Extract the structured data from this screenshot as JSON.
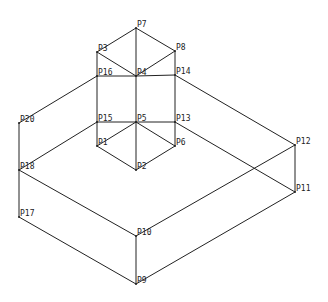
{
  "diagram": {
    "type": "isometric-wireframe",
    "vertices": [
      {
        "id": "P1",
        "label": "P1",
        "x": 97,
        "y": 146
      },
      {
        "id": "P2",
        "label": "P2",
        "x": 136,
        "y": 170
      },
      {
        "id": "P3",
        "label": "P3",
        "x": 97,
        "y": 52
      },
      {
        "id": "P4",
        "label": "P4",
        "x": 136,
        "y": 76
      },
      {
        "id": "P5",
        "label": "P5",
        "x": 136,
        "y": 122
      },
      {
        "id": "P6",
        "label": "P6",
        "x": 175,
        "y": 146
      },
      {
        "id": "P7",
        "label": "P7",
        "x": 136,
        "y": 28
      },
      {
        "id": "P8",
        "label": "P8",
        "x": 175,
        "y": 51
      },
      {
        "id": "P9",
        "label": "P9",
        "x": 136,
        "y": 284
      },
      {
        "id": "P10",
        "label": "P10",
        "x": 136,
        "y": 236
      },
      {
        "id": "P11",
        "label": "P11",
        "x": 295,
        "y": 192
      },
      {
        "id": "P12",
        "label": "P12",
        "x": 295,
        "y": 145
      },
      {
        "id": "P13",
        "label": "P13",
        "x": 175,
        "y": 122
      },
      {
        "id": "P14",
        "label": "P14",
        "x": 175,
        "y": 75
      },
      {
        "id": "P15",
        "label": "P15",
        "x": 97,
        "y": 122
      },
      {
        "id": "P16",
        "label": "P16",
        "x": 97,
        "y": 76
      },
      {
        "id": "P17",
        "label": "P17",
        "x": 19,
        "y": 217
      },
      {
        "id": "P18",
        "label": "P18",
        "x": 19,
        "y": 170
      },
      {
        "id": "P20",
        "label": "P20",
        "x": 19,
        "y": 123
      }
    ],
    "edges": [
      [
        "P7",
        "P3"
      ],
      [
        "P7",
        "P8"
      ],
      [
        "P7",
        "P4"
      ],
      [
        "P3",
        "P4"
      ],
      [
        "P8",
        "P4"
      ],
      [
        "P3",
        "P16"
      ],
      [
        "P8",
        "P14"
      ],
      [
        "P16",
        "P4"
      ],
      [
        "P4",
        "P14"
      ],
      [
        "P16",
        "P20"
      ],
      [
        "P14",
        "P12"
      ],
      [
        "P16",
        "P15"
      ],
      [
        "P14",
        "P13"
      ],
      [
        "P4",
        "P5"
      ],
      [
        "P15",
        "P5"
      ],
      [
        "P5",
        "P13"
      ],
      [
        "P15",
        "P18"
      ],
      [
        "P13",
        "P11"
      ],
      [
        "P15",
        "P1"
      ],
      [
        "P13",
        "P6"
      ],
      [
        "P5",
        "P1"
      ],
      [
        "P5",
        "P6"
      ],
      [
        "P5",
        "P2"
      ],
      [
        "P1",
        "P2"
      ],
      [
        "P6",
        "P2"
      ],
      [
        "P20",
        "P18"
      ],
      [
        "P18",
        "P17"
      ],
      [
        "P18",
        "P10"
      ],
      [
        "P10",
        "P12"
      ],
      [
        "P12",
        "P11"
      ],
      [
        "P17",
        "P9"
      ],
      [
        "P10",
        "P9"
      ],
      [
        "P9",
        "P11"
      ]
    ],
    "colors": {
      "line": "#222222",
      "background": "#ffffff"
    }
  }
}
